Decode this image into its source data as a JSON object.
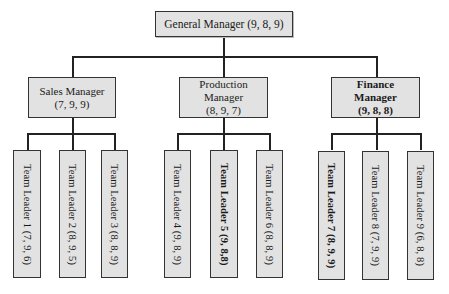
{
  "diagram": {
    "type": "org-chart",
    "root": {
      "label": "General Manager (9, 8, 9)",
      "title": "General Manager",
      "scores": [
        9,
        8,
        9
      ]
    },
    "managers": [
      {
        "title_line1": "Sales Manager",
        "title_line2": "",
        "scores_label": "(7, 9, 9)",
        "scores": [
          7,
          9,
          9
        ],
        "bold": false,
        "team_leaders": [
          {
            "label": "Team Leader 1  (7, 9, 6)",
            "scores": [
              7,
              9,
              6
            ],
            "bold": false
          },
          {
            "label": "Team Leader 2  (8, 9, 5)",
            "scores": [
              8,
              9,
              5
            ],
            "bold": false
          },
          {
            "label": "Team Leader 3  (8, 8, 9)",
            "scores": [
              8,
              8,
              9
            ],
            "bold": false
          }
        ]
      },
      {
        "title_line1": "Production",
        "title_line2": "Manager",
        "scores_label": "(8, 9, 7)",
        "scores": [
          8,
          9,
          7
        ],
        "bold": false,
        "team_leaders": [
          {
            "label": "Team Leader 4  (9, 8, 9)",
            "scores": [
              9,
              8,
              9
            ],
            "bold": false
          },
          {
            "label": "Team Leader 5  (9, 8,8)",
            "scores": [
              9,
              8,
              8
            ],
            "bold": true
          },
          {
            "label": "Team Leader 6  (8, 8, 9)",
            "scores": [
              8,
              8,
              9
            ],
            "bold": false
          }
        ]
      },
      {
        "title_line1": "Finance",
        "title_line2": "Manager",
        "scores_label": "(9, 8, 8)",
        "scores": [
          9,
          8,
          8
        ],
        "bold": true,
        "team_leaders": [
          {
            "label": "Team Leader 7  (8, 9, 9)",
            "scores": [
              8,
              9,
              9
            ],
            "bold": true
          },
          {
            "label": "Team Leader 8  (7, 9, 9)",
            "scores": [
              7,
              9,
              9
            ],
            "bold": false
          },
          {
            "label": "Team Leader 9  (6, 8, 8)",
            "scores": [
              6,
              8,
              8
            ],
            "bold": false
          }
        ]
      }
    ]
  },
  "colors": {
    "box_fill": "#e2e2e2",
    "border": "#333333",
    "line": "#222222"
  }
}
